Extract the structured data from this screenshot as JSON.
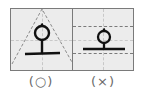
{
  "panels": [
    {
      "id": "correct",
      "glyph": "오",
      "guide": "triangle",
      "caption": "(○)"
    },
    {
      "id": "incorrect",
      "glyph": "오",
      "guide": "horizontal-lines",
      "caption": "(×)"
    }
  ],
  "colors": {
    "panel_bg": "#ececec",
    "border": "#7a7a7a",
    "guide_light": "#c8c8c8",
    "glyph": "#111111",
    "caption": "#6a6a6a"
  }
}
